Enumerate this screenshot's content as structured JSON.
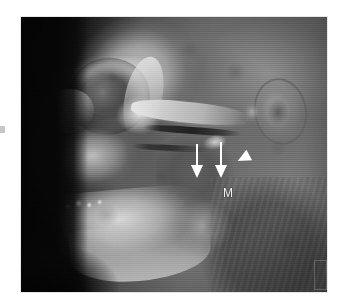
{
  "figure": {
    "modality": "3D CT reconstruction",
    "view": "lateral oblique",
    "region": "craniofacial skeleton",
    "background_color": "#ffffff",
    "frame": {
      "x": 21,
      "y": 17,
      "width": 306,
      "height": 275,
      "border_color": "#e8e8e8",
      "base_color": "#070707"
    }
  },
  "annotations": {
    "arrows": [
      {
        "id": "arrow-1",
        "name": "arrow-left",
        "direction": "down",
        "color": "#ffffff",
        "x": 170,
        "y": 127,
        "length": 34
      },
      {
        "id": "arrow-2",
        "name": "arrow-right",
        "direction": "down",
        "color": "#ffffff",
        "x": 194,
        "y": 125,
        "length": 36
      }
    ],
    "arrowheads": [
      {
        "id": "arrowhead-1",
        "name": "arrowhead",
        "direction": "down-left",
        "color": "#ffffff",
        "x": 216,
        "y": 135
      }
    ],
    "labels": [
      {
        "id": "label-m",
        "text": "M",
        "color": "#f4f4f4",
        "x": 202,
        "y": 170
      }
    ],
    "edge_marks": [
      {
        "id": "edge-mark-left",
        "name": "left-edge-tick",
        "color": "#969696",
        "x": 0,
        "y": 126
      },
      {
        "id": "edge-mark-right",
        "name": "right-margin-rectangle",
        "color": "#828282",
        "x": 293,
        "y": 243
      }
    ]
  },
  "anatomy": {
    "structures": [
      "frontal bone",
      "supraorbital rim",
      "orbital cavity",
      "lateral orbital wall",
      "nasal bridge",
      "maxilla",
      "zygomatic arch",
      "zygomatic body",
      "fracture line",
      "displaced bone fragment",
      "mandibular ramus",
      "mandibular body",
      "mandibular angle",
      "teeth",
      "auricle",
      "neck soft tissue"
    ]
  },
  "palette": {
    "paper": "#ffffff",
    "air": "#070707",
    "soft_tissue": "#7a7a7a",
    "bone_bright": "#e4e4e4",
    "bone_mid": "#b4b4b4",
    "shadow": "#3c3c3c",
    "marker": "#ffffff"
  }
}
